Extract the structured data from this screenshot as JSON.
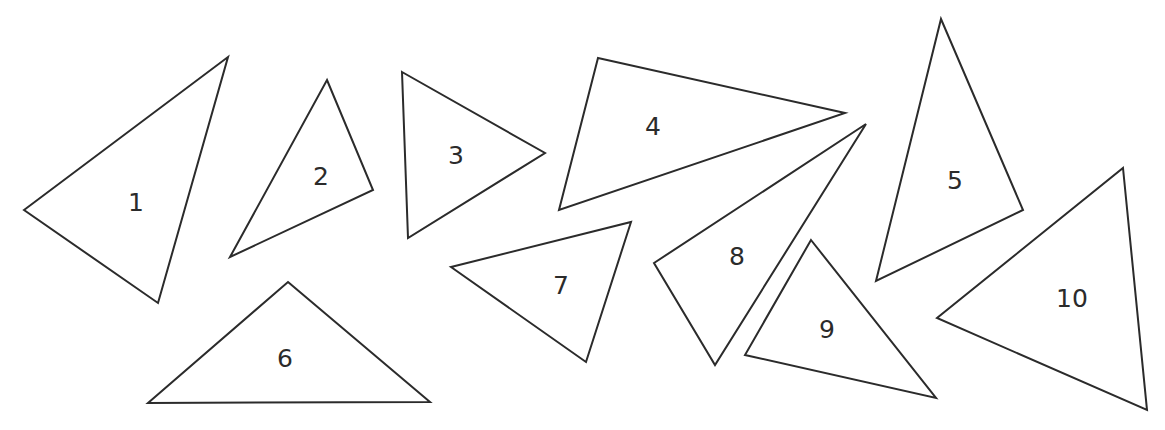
{
  "figure": {
    "background_color": "#ffffff",
    "stroke_color": "#2b2b2b",
    "label_color": "#2b2b2b",
    "stroke_width": 2,
    "label_font_size": 25,
    "width": 1165,
    "height": 430
  },
  "shapes": [
    {
      "label": "1",
      "name": "triangle-1",
      "points": "24,210 228,57 158,303",
      "label_x": 136,
      "label_y": 204
    },
    {
      "label": "2",
      "name": "triangle-2",
      "points": "327,80 373,190 230,257",
      "label_x": 321,
      "label_y": 178
    },
    {
      "label": "3",
      "name": "triangle-3",
      "points": "402,72 545,153 408,238",
      "label_x": 456,
      "label_y": 157
    },
    {
      "label": "4",
      "name": "triangle-4",
      "points": "598,58 845,113 559,210",
      "label_x": 653,
      "label_y": 128
    },
    {
      "label": "5",
      "name": "triangle-5",
      "points": "941,19 1023,210 876,281",
      "label_x": 955,
      "label_y": 182
    },
    {
      "label": "6",
      "name": "triangle-6",
      "points": "288,282 430,402 148,403",
      "label_x": 285,
      "label_y": 360
    },
    {
      "label": "7",
      "name": "triangle-7",
      "points": "451,267 631,222 586,362",
      "label_x": 561,
      "label_y": 287
    },
    {
      "label": "8",
      "name": "triangle-8",
      "points": "654,263 866,124 715,365",
      "label_x": 737,
      "label_y": 258
    },
    {
      "label": "9",
      "name": "triangle-9",
      "points": "811,240 936,398 745,355",
      "label_x": 827,
      "label_y": 331
    },
    {
      "label": "10",
      "name": "triangle-10",
      "points": "1123,168 1147,410 937,318",
      "label_x": 1072,
      "label_y": 300
    }
  ]
}
